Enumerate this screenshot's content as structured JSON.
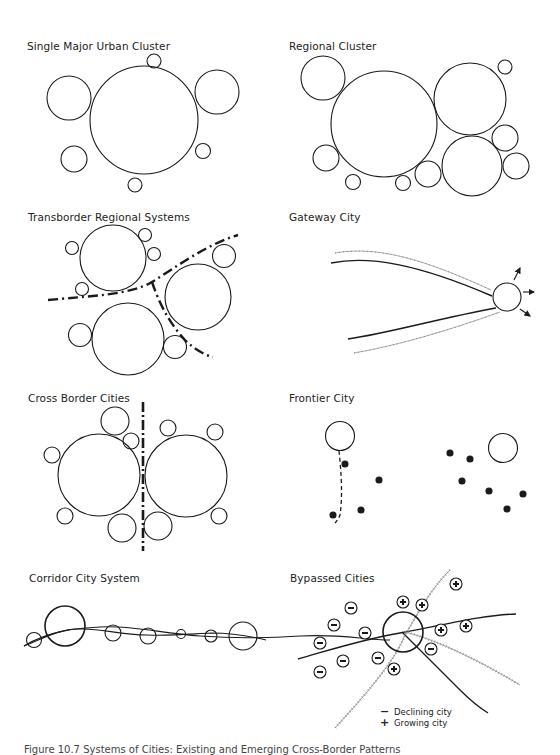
{
  "panels": [
    {
      "id": "single-major-urban-cluster",
      "title": "Single Major Urban Cluster"
    },
    {
      "id": "regional-cluster",
      "title": "Regional Cluster"
    },
    {
      "id": "transborder-regional-systems",
      "title": "Transborder Regional Systems"
    },
    {
      "id": "gateway-city",
      "title": "Gateway City"
    },
    {
      "id": "cross-border-cities",
      "title": "Cross Border Cities"
    },
    {
      "id": "frontier-city",
      "title": "Frontier City"
    },
    {
      "id": "corridor-city-system",
      "title": "Corridor City System"
    },
    {
      "id": "bypassed-cities",
      "title": "Bypassed Cities"
    }
  ],
  "legend": {
    "declining": {
      "symbol": "−",
      "label": "Declining city"
    },
    "growing": {
      "symbol": "+",
      "label": "Growing city"
    }
  },
  "caption": "Figure 10.7  Systems of Cities: Existing and Emerging Cross-Border Patterns",
  "colors": {
    "stroke": "#1a1a1a",
    "rail": "#777777",
    "background": "#ffffff"
  }
}
